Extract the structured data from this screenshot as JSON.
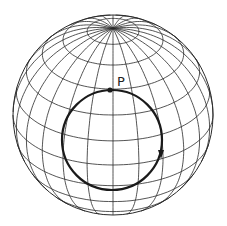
{
  "diagram": {
    "type": "sphere-with-circle-path",
    "sphere": {
      "cx": 113,
      "cy": 115,
      "r": 100,
      "view_latitude_deg": 30,
      "meridian_count": 24,
      "parallel_step_deg": 15,
      "stroke": "#2a2a2a"
    },
    "circle_path": {
      "cx": 112,
      "cy": 140,
      "rx": 50,
      "ry": 50,
      "stroke": "#1a1a1a"
    },
    "point": {
      "label": "P",
      "x": 110,
      "y": 90,
      "label_x": 117,
      "label_y": 86
    },
    "arrow": {
      "x": 161,
      "y": 155,
      "direction": "down"
    }
  }
}
